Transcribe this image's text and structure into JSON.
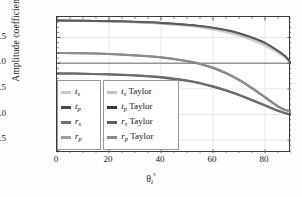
{
  "chart_data": {
    "type": "line",
    "title": "",
    "xlabel": "θi°",
    "ylabel": "Amplitude coefficient",
    "xlim": [
      0,
      90
    ],
    "ylim": [
      -1.75,
      0.9
    ],
    "xticks": [
      "0",
      "20",
      "40",
      "60",
      "80"
    ],
    "xtick_values": [
      0,
      20,
      40,
      60,
      80
    ],
    "yticks": [
      "0.5",
      "0.0",
      "-0.5",
      "-1.0",
      "-1.5"
    ],
    "ytick_values": [
      0.5,
      0.0,
      -0.5,
      -1.0,
      -1.5
    ],
    "grid": true,
    "legend_position": "lower-left",
    "x": [
      0,
      10,
      20,
      30,
      40,
      50,
      55,
      60,
      65,
      70,
      75,
      80,
      85,
      88,
      90
    ],
    "series": [
      {
        "name": "ts",
        "label": "t_s",
        "color": "#c9c9c9",
        "style": "solid",
        "values": [
          0.83,
          0.825,
          0.815,
          0.8,
          0.775,
          0.735,
          0.705,
          0.665,
          0.615,
          0.55,
          0.465,
          0.36,
          0.215,
          0.11,
          0.0
        ]
      },
      {
        "name": "tp",
        "label": "t_p",
        "color": "#5a5a5a",
        "style": "solid",
        "values": [
          0.83,
          0.827,
          0.82,
          0.806,
          0.785,
          0.75,
          0.725,
          0.69,
          0.645,
          0.585,
          0.5,
          0.395,
          0.24,
          0.125,
          0.0
        ]
      },
      {
        "name": "rs",
        "label": "r_s",
        "color": "#6e6e6e",
        "style": "solid",
        "values": [
          -0.2,
          -0.205,
          -0.215,
          -0.235,
          -0.27,
          -0.335,
          -0.385,
          -0.45,
          -0.525,
          -0.615,
          -0.715,
          -0.82,
          -0.925,
          -0.975,
          -1.0
        ]
      },
      {
        "name": "rp",
        "label": "r_p",
        "color": "#8c8c8c",
        "style": "solid",
        "values": [
          0.2,
          0.195,
          0.18,
          0.155,
          0.115,
          0.045,
          -0.01,
          -0.085,
          -0.19,
          -0.32,
          -0.48,
          -0.655,
          -0.835,
          -0.91,
          -0.935
        ]
      },
      {
        "name": "ts_taylor",
        "label": "t_s Taylor",
        "color": "#d4d4d4",
        "style": "solid",
        "values": [
          0.83,
          0.825,
          0.814,
          0.797,
          0.77,
          0.728,
          0.697,
          0.655,
          0.6,
          0.532,
          0.445,
          0.34,
          0.2,
          0.1,
          0.0
        ]
      },
      {
        "name": "tp_taylor",
        "label": "t_p Taylor",
        "color": "#3f3f3f",
        "style": "solid",
        "values": [
          0.83,
          0.827,
          0.819,
          0.804,
          0.782,
          0.746,
          0.72,
          0.684,
          0.638,
          0.577,
          0.492,
          0.386,
          0.233,
          0.12,
          0.0
        ]
      },
      {
        "name": "rs_taylor",
        "label": "r_s Taylor",
        "color": "#555555",
        "style": "solid",
        "values": [
          -0.2,
          -0.206,
          -0.218,
          -0.24,
          -0.277,
          -0.343,
          -0.393,
          -0.458,
          -0.533,
          -0.622,
          -0.722,
          -0.826,
          -0.928,
          -0.978,
          -1.0
        ]
      },
      {
        "name": "rp_taylor",
        "label": "r_p Taylor",
        "color": "#777777",
        "style": "solid",
        "values": [
          0.2,
          0.194,
          0.178,
          0.151,
          0.11,
          0.038,
          -0.018,
          -0.094,
          -0.2,
          -0.332,
          -0.492,
          -0.667,
          -0.845,
          -0.918,
          -0.94
        ]
      }
    ],
    "zero_line": 0.0
  },
  "axis": {
    "ylabel_text": "Amplitude coefficient",
    "xlabel_theta": "θ",
    "xlabel_sub": "i",
    "xlabel_deg": "°"
  },
  "legend": {
    "left_column": [
      {
        "label_base": "t",
        "label_sub": "s",
        "swatch": "#c9c9c9"
      },
      {
        "label_base": "t",
        "label_sub": "p",
        "swatch": "#4a4a4a"
      },
      {
        "label_base": "r",
        "label_sub": "s",
        "swatch": "#6e6e6e"
      },
      {
        "label_base": "r",
        "label_sub": "p",
        "swatch": "#9e9e9e"
      }
    ],
    "right_column": [
      {
        "label_base": "t",
        "label_sub": "s",
        "suffix": " Taylor",
        "swatch": "#c2c2c2"
      },
      {
        "label_base": "t",
        "label_sub": "p",
        "suffix": " Taylor",
        "swatch": "#3a3a3a"
      },
      {
        "label_base": "r",
        "label_sub": "s",
        "suffix": " Taylor",
        "swatch": "#5f5f5f"
      },
      {
        "label_base": "r",
        "label_sub": "p",
        "suffix": " Taylor",
        "swatch": "#8a8a8a"
      }
    ]
  }
}
